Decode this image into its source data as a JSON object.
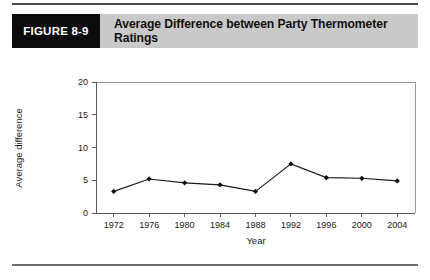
{
  "figure": {
    "tag_label": "FIGURE 8-9",
    "title": "Average Difference between Party Thermometer Ratings"
  },
  "colors": {
    "tag_background": "#0b0b0b",
    "tag_text": "#ffffff",
    "header_background": "#c9c9c9",
    "title_text": "#111111",
    "rule": "#4a4a4a",
    "series": "#1a1a1a",
    "axis": "#5a5a5a",
    "frame": "#9a9a9a",
    "page_background": "#ffffff"
  },
  "chart_data": {
    "type": "line",
    "title": "Average Difference between Party Thermometer Ratings",
    "xlabel": "Year",
    "ylabel": "Average difference",
    "categories": [
      "1972",
      "1976",
      "1980",
      "1984",
      "1988",
      "1992",
      "1996",
      "2000",
      "2004"
    ],
    "x": [
      1972,
      1976,
      1980,
      1984,
      1988,
      1992,
      1996,
      2000,
      2004
    ],
    "values": [
      3.3,
      5.2,
      4.6,
      4.3,
      3.3,
      7.5,
      5.4,
      5.3,
      4.9
    ],
    "series": [
      {
        "name": "Average difference",
        "values": [
          3.3,
          5.2,
          4.6,
          4.3,
          3.3,
          7.5,
          5.4,
          5.3,
          4.9
        ]
      }
    ],
    "ylim": [
      0,
      20
    ],
    "yticks": [
      0,
      5,
      10,
      15,
      20
    ],
    "ytick_labels": [
      "0",
      "5",
      "10",
      "15",
      "20"
    ],
    "xlim": [
      1970,
      2006
    ],
    "xticks": [
      1972,
      1976,
      1980,
      1984,
      1988,
      1992,
      1996,
      2000,
      2004
    ],
    "xtick_labels": [
      "1972",
      "1976",
      "1980",
      "1984",
      "1988",
      "1992",
      "1996",
      "2000",
      "2004"
    ],
    "grid": false,
    "legend": false,
    "marker": "diamond"
  }
}
